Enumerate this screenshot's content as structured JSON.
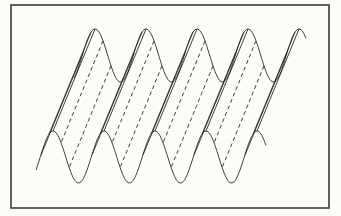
{
  "figure": {
    "frame": {
      "x": 11,
      "y": 5,
      "width": 318,
      "height": 203,
      "stroke": "#3a3a3a"
    },
    "curve_color": "#2a2a2a",
    "background": "#fcfcf8",
    "top_curve": {
      "x_start": 74,
      "x_end": 306,
      "baseline_y": 55.5,
      "amplitude": 26.5,
      "period": 51,
      "first_peak_x": 95
    },
    "bottom_curve": {
      "x_start": 36,
      "x_end": 266,
      "baseline_y": 157,
      "amplitude": 26,
      "period": 51,
      "first_peak_x": 53
    },
    "shear": {
      "dx": -42,
      "dy": 102
    },
    "periods": 5
  }
}
